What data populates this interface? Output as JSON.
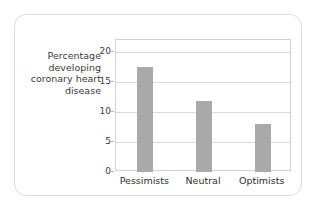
{
  "chart_data": {
    "type": "bar",
    "title": "",
    "xlabel": "",
    "ylabel": "Percentage developing coronary heart disease",
    "categories": [
      "Pessimists",
      "Neutral",
      "Optimists"
    ],
    "values": [
      17.5,
      11.8,
      8.0
    ],
    "ylim": [
      0,
      22
    ],
    "yticks": [
      0,
      5,
      10,
      15,
      20
    ],
    "ytick_labels": [
      "0",
      "5",
      "10",
      "15",
      "20"
    ],
    "grid": true,
    "legend": null,
    "bar_color": "#a9a9a9",
    "plot_border_color": "#d3d3d3",
    "gridline_color": "#d9d9d9",
    "card_border_color": "#dcdcdc",
    "background_color": "#ffffff",
    "text_color": "#3b3b3b"
  }
}
